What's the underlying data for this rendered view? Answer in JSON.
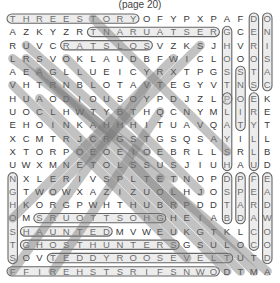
{
  "title": "(page 20)",
  "grid": [
    [
      "T",
      "H",
      "R",
      "E",
      "E",
      "S",
      "T",
      "O",
      "R",
      "Y",
      "O",
      "F",
      "Y",
      "P",
      "X",
      "P",
      "A",
      "F",
      "D",
      "O"
    ],
    [
      "A",
      "Z",
      "K",
      "Y",
      "Z",
      "R",
      "T",
      "N",
      "A",
      "R",
      "U",
      "A",
      "T",
      "S",
      "E",
      "R",
      "G",
      "C",
      "E",
      "N"
    ],
    [
      "R",
      "U",
      "V",
      "C",
      "R",
      "A",
      "T",
      "S",
      "L",
      "O",
      "S",
      "V",
      "Z",
      "K",
      "S",
      "J",
      "H",
      "V",
      "R",
      "I"
    ],
    [
      "L",
      "R",
      "S",
      "V",
      "O",
      "K",
      "L",
      "A",
      "U",
      "D",
      "B",
      "F",
      "W",
      "I",
      "C",
      "L",
      "O",
      "O",
      "O",
      "S"
    ],
    [
      "A",
      "E",
      "A",
      "G",
      "L",
      "L",
      "U",
      "E",
      "I",
      "C",
      "Y",
      "R",
      "X",
      "T",
      "P",
      "G",
      "S",
      "S",
      "T",
      "A"
    ],
    [
      "V",
      "H",
      "T",
      "R",
      "N",
      "B",
      "L",
      "O",
      "T",
      "A",
      "V",
      "T",
      "E",
      "G",
      "Y",
      "V",
      "T",
      "N",
      "S",
      "C"
    ],
    [
      "H",
      "U",
      "A",
      "O",
      "D",
      "I",
      "O",
      "U",
      "S",
      "O",
      "Y",
      "P",
      "D",
      "J",
      "Z",
      "L",
      "P",
      "O",
      "E",
      "K"
    ],
    [
      "U",
      "O",
      "C",
      "L",
      "H",
      "W",
      "T",
      "Y",
      "B",
      "T",
      "H",
      "Q",
      "C",
      "N",
      "Y",
      "M",
      "L",
      "I",
      "R",
      "E"
    ],
    [
      "E",
      "H",
      "O",
      "I",
      "N",
      "K",
      "A",
      "H",
      "H",
      "H",
      "I",
      "T",
      "U",
      "A",
      "V",
      "Q",
      "A",
      "T",
      "Y",
      "T"
    ],
    [
      "X",
      "C",
      "M",
      "T",
      "R",
      "J",
      "C",
      "R",
      "G",
      "S",
      "T",
      "G",
      "S",
      "Q",
      "S",
      "A",
      "Y",
      "I",
      "L",
      "L"
    ],
    [
      "X",
      "T",
      "O",
      "R",
      "P",
      "O",
      "E",
      "O",
      "E",
      "I",
      "O",
      "E",
      "B",
      "R",
      "L",
      "L",
      "S",
      "R",
      "L",
      "B"
    ],
    [
      "U",
      "W",
      "X",
      "M",
      "N",
      "E",
      "T",
      "O",
      "L",
      "S",
      "S",
      "U",
      "S",
      "J",
      "I",
      "U",
      "H",
      "A",
      "U",
      "D"
    ],
    [
      "N",
      "X",
      "L",
      "E",
      "R",
      "I",
      "V",
      "S",
      "P",
      "L",
      "T",
      "E",
      "T",
      "N",
      "O",
      "P",
      "D",
      "P",
      "F",
      "E"
    ],
    [
      "G",
      "T",
      "W",
      "O",
      "W",
      "X",
      "A",
      "Z",
      "I",
      "Z",
      "U",
      "O",
      "L",
      "H",
      "J",
      "O",
      "S",
      "P",
      "E",
      "A"
    ],
    [
      "H",
      "K",
      "O",
      "R",
      "G",
      "P",
      "W",
      "H",
      "T",
      "H",
      "U",
      "B",
      "R",
      "P",
      "D",
      "D",
      "T",
      "A",
      "R",
      "D"
    ],
    [
      "O",
      "M",
      "S",
      "R",
      "U",
      "O",
      "T",
      "T",
      "S",
      "O",
      "H",
      "G",
      "H",
      "E",
      "I",
      "A",
      "B",
      "D",
      "A",
      "W"
    ],
    [
      "S",
      "H",
      "A",
      "U",
      "N",
      "T",
      "E",
      "D",
      "M",
      "V",
      "W",
      "E",
      "U",
      "K",
      "G",
      "T",
      "K",
      "L",
      "C",
      "O"
    ],
    [
      "T",
      "G",
      "H",
      "O",
      "S",
      "T",
      "H",
      "U",
      "N",
      "T",
      "E",
      "R",
      "S",
      "G",
      "S",
      "U",
      "L",
      "O",
      "C",
      "O"
    ],
    [
      "S",
      "O",
      "V",
      "T",
      "E",
      "D",
      "D",
      "Y",
      "R",
      "O",
      "O",
      "S",
      "E",
      "V",
      "E",
      "L",
      "T",
      "U",
      "T",
      "D"
    ],
    [
      "F",
      "F",
      "I",
      "R",
      "E",
      "H",
      "S",
      "T",
      "S",
      "R",
      "I",
      "F",
      "S",
      "N",
      "W",
      "O",
      "D",
      "T",
      "M",
      "A"
    ]
  ],
  "found_words": [
    {
      "word": "THREESTORY",
      "dir": "horizontal",
      "row": 0,
      "col": 0,
      "len": 10
    },
    {
      "word": "RESTAURANT",
      "dir": "horizontal",
      "row": 1,
      "col": 6,
      "len": 10
    },
    {
      "word": "SOLSTAR",
      "dir": "horizontal",
      "row": 2,
      "col": 4,
      "len": 7
    },
    {
      "word": "HAUNTED",
      "dir": "horizontal",
      "row": 16,
      "col": 1,
      "len": 7
    },
    {
      "word": "GHOSTHUNTERS",
      "dir": "horizontal",
      "row": 17,
      "col": 1,
      "len": 12
    },
    {
      "word": "TEDDYROOSEVELT",
      "dir": "horizontal",
      "row": 18,
      "col": 3,
      "len": 14
    },
    {
      "word": "FIRSTFIRE",
      "dir": "horizontal",
      "row": 19,
      "col": 0,
      "len": 16
    },
    {
      "word": "GHOSTTOURS",
      "dir": "horizontal",
      "row": 15,
      "col": 2,
      "len": 10
    },
    {
      "word": "GHOSTS",
      "dir": "vertical",
      "row": 1,
      "col": 16,
      "len": 6
    },
    {
      "word": "DEROSA",
      "dir": "vertical",
      "row": 0,
      "col": 18,
      "len": 6
    },
    {
      "word": "ONISAC",
      "dir": "vertical",
      "row": 0,
      "col": 19,
      "len": 6
    },
    {
      "word": "SNOIT",
      "dir": "vertical",
      "row": 4,
      "col": 17,
      "len": 5
    },
    {
      "word": "PLAYSH",
      "dir": "vertical",
      "row": 6,
      "col": 16,
      "len": 6
    },
    {
      "word": "ERYLLU",
      "dir": "vertical",
      "row": 6,
      "col": 18,
      "len": 6
    },
    {
      "word": "DSTAB",
      "dir": "vertical",
      "row": 12,
      "col": 16,
      "len": 4
    },
    {
      "word": "PPAD",
      "dir": "vertical",
      "row": 12,
      "col": 17,
      "len": 4
    },
    {
      "word": "FERAC",
      "dir": "vertical",
      "row": 12,
      "col": 18,
      "len": 6
    },
    {
      "word": "EADWOOD",
      "dir": "vertical",
      "row": 12,
      "col": 19,
      "len": 7
    },
    {
      "word": "NGHOST",
      "dir": "vertical",
      "row": 12,
      "col": 0,
      "len": 7
    }
  ]
}
